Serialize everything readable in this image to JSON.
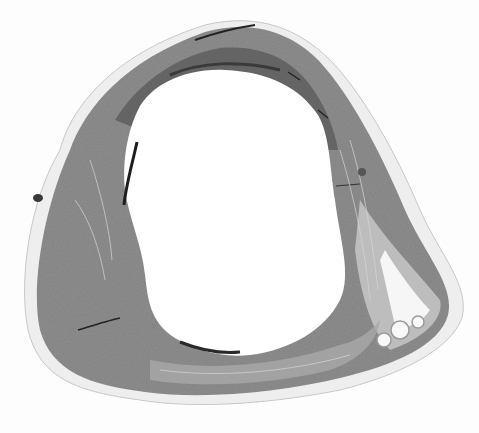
{
  "image": {
    "kind": "histology-cross-section",
    "description": "Grayscale micrograph of a ring-shaped tissue section (heart/vessel wall) with a large empty lumen",
    "width": 479,
    "height": 433,
    "colors": {
      "background": "#fdfdfd",
      "tissue_dark": "#6e6e6e",
      "tissue_mid": "#8c8c8c",
      "tissue_light": "#b4b4b4",
      "tissue_pale": "#d8d8d8",
      "fissure": "#1e1e1e",
      "lumen": "#ffffff"
    }
  }
}
